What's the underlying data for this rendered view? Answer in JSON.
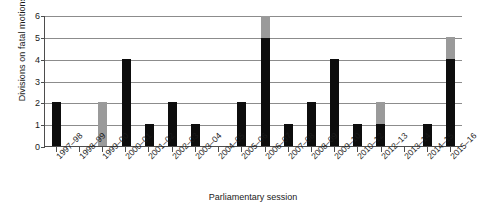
{
  "chart_data": {
    "type": "bar",
    "title": "",
    "subtitle": "",
    "xlabel": "Parliamentary session",
    "ylabel": "Divisions on fatal motions",
    "ylim": [
      0,
      6
    ],
    "yticks": [
      0,
      1,
      2,
      3,
      4,
      5,
      6
    ],
    "grid": true,
    "legend": "none",
    "stacked": true,
    "bar_color_primary": "#0d0d0d",
    "bar_color_secondary": "#9a9a9a",
    "categories": [
      "1997–98",
      "1998–99",
      "1999–00",
      "2000–01",
      "2001–02",
      "2002–03",
      "2003–04",
      "2004–05",
      "2005–06",
      "2006–07",
      "2007–08",
      "2008–09",
      "2009–10",
      "2010–12",
      "2012–13",
      "2013–14",
      "2014–15",
      "2015–16"
    ],
    "series": [
      {
        "name": "black",
        "color": "#0d0d0d",
        "values": [
          2,
          0,
          0,
          4,
          1,
          2,
          1,
          0,
          2,
          5,
          1,
          2,
          4,
          1,
          1,
          0,
          1,
          4
        ]
      },
      {
        "name": "grey",
        "color": "#9a9a9a",
        "values": [
          0,
          0,
          2,
          0,
          0,
          0,
          0,
          0,
          0,
          1,
          0,
          0,
          0,
          0,
          1,
          0,
          0,
          1
        ]
      }
    ],
    "totals": [
      2,
      0,
      2,
      4,
      1,
      2,
      1,
      0,
      2,
      6,
      1,
      2,
      4,
      1,
      2,
      0,
      1,
      5
    ]
  }
}
